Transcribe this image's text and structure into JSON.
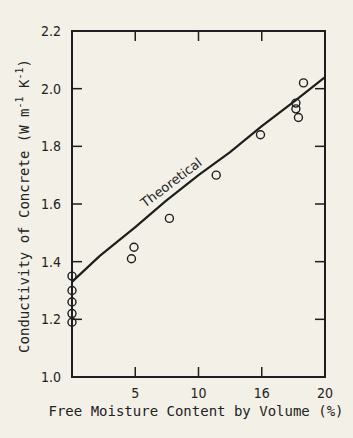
{
  "chart_data": {
    "type": "scatter",
    "title": "",
    "xlabel": "Free Moisture Content by Volume (%)",
    "ylabel": "Conductivity of Concrete (W m-1 K-1)",
    "ylabel_parts": {
      "main": "Conductivity of Concrete (W m",
      "exp1": "-1",
      "mid": " K",
      "exp2": "-1",
      "end": ")"
    },
    "xlim": [
      0,
      20
    ],
    "ylim": [
      1.0,
      2.2
    ],
    "x_ticks": [
      {
        "value": 5,
        "label": "5"
      },
      {
        "value": 10,
        "label": "10"
      },
      {
        "value": 15,
        "label": "16"
      },
      {
        "value": 20,
        "label": "20"
      }
    ],
    "y_ticks": [
      {
        "value": 1.0,
        "label": "1.0"
      },
      {
        "value": 1.2,
        "label": "1.2"
      },
      {
        "value": 1.4,
        "label": "1.4"
      },
      {
        "value": 1.6,
        "label": "1.6"
      },
      {
        "value": 1.8,
        "label": "1.8"
      },
      {
        "value": 2.0,
        "label": "2.0"
      },
      {
        "value": 2.2,
        "label": "2.2"
      }
    ],
    "grid": false,
    "legend": null,
    "series": [
      {
        "name": "Measured",
        "type": "scatter",
        "marker": "open-circle",
        "points": [
          {
            "x": 0,
            "y": 1.35
          },
          {
            "x": 0,
            "y": 1.3
          },
          {
            "x": 0,
            "y": 1.26
          },
          {
            "x": 0,
            "y": 1.22
          },
          {
            "x": 0,
            "y": 1.19
          },
          {
            "x": 4.7,
            "y": 1.41
          },
          {
            "x": 4.9,
            "y": 1.45
          },
          {
            "x": 7.7,
            "y": 1.55
          },
          {
            "x": 11.4,
            "y": 1.7
          },
          {
            "x": 14.9,
            "y": 1.84
          },
          {
            "x": 17.7,
            "y": 1.95
          },
          {
            "x": 17.7,
            "y": 1.93
          },
          {
            "x": 17.9,
            "y": 1.9
          },
          {
            "x": 18.3,
            "y": 2.02
          }
        ]
      },
      {
        "name": "Theoretical",
        "type": "line",
        "label": "Theoretical",
        "points": [
          {
            "x": 0,
            "y": 1.33
          },
          {
            "x": 2.2,
            "y": 1.42
          },
          {
            "x": 5,
            "y": 1.52
          },
          {
            "x": 7.4,
            "y": 1.61
          },
          {
            "x": 10,
            "y": 1.7
          },
          {
            "x": 12.5,
            "y": 1.78
          },
          {
            "x": 15,
            "y": 1.87
          },
          {
            "x": 17.7,
            "y": 1.96
          },
          {
            "x": 20,
            "y": 2.04
          }
        ]
      }
    ]
  },
  "colors": {
    "background": "#f3f0e7",
    "ink": "#1e1e1e"
  }
}
